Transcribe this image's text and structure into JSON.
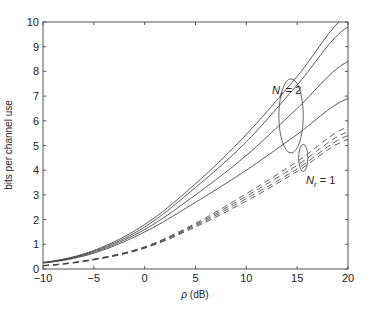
{
  "chart_data": {
    "type": "line",
    "title": "",
    "xlabel": "ρ (dB)",
    "ylabel": "bits per channel use",
    "xlim": [
      -10,
      20
    ],
    "ylim": [
      0,
      10
    ],
    "xticks": [
      -10,
      -5,
      0,
      5,
      10,
      15,
      20
    ],
    "yticks": [
      0,
      1,
      2,
      3,
      4,
      5,
      6,
      7,
      8,
      9,
      10
    ],
    "grid": false,
    "x": [
      -10,
      -5,
      0,
      5,
      10,
      15,
      20
    ],
    "series": [
      {
        "name": "Nr=2 (curve 1)",
        "group": "Nr = 2",
        "style": "solid",
        "values": [
          0.27,
          0.75,
          1.8,
          3.45,
          5.45,
          7.8,
          10.3
        ]
      },
      {
        "name": "Nr=2 (curve 2)",
        "group": "Nr = 2",
        "style": "solid",
        "values": [
          0.26,
          0.72,
          1.7,
          3.3,
          5.15,
          7.45,
          9.8
        ]
      },
      {
        "name": "Nr=2 (curve 3)",
        "group": "Nr = 2",
        "style": "solid",
        "values": [
          0.25,
          0.68,
          1.6,
          3.0,
          4.6,
          6.5,
          8.4
        ]
      },
      {
        "name": "Nr=2 (curve 4)",
        "group": "Nr = 2",
        "style": "solid",
        "values": [
          0.24,
          0.64,
          1.5,
          2.7,
          4.0,
          5.45,
          6.9
        ]
      },
      {
        "name": "Nr=1 (curve 1)",
        "group": "Nr = 1",
        "style": "dashed",
        "values": [
          0.14,
          0.4,
          0.9,
          1.85,
          3.05,
          4.35,
          5.75
        ]
      },
      {
        "name": "Nr=1 (curve 2)",
        "group": "Nr = 1",
        "style": "dashed",
        "values": [
          0.14,
          0.39,
          0.88,
          1.8,
          2.95,
          4.2,
          5.55
        ]
      },
      {
        "name": "Nr=1 (curve 3)",
        "group": "Nr = 1",
        "style": "dashed",
        "values": [
          0.13,
          0.38,
          0.86,
          1.75,
          2.85,
          4.05,
          5.4
        ]
      },
      {
        "name": "Nr=1 (curve 4)",
        "group": "Nr = 1",
        "style": "dashed",
        "values": [
          0.13,
          0.37,
          0.84,
          1.7,
          2.75,
          3.95,
          5.25
        ]
      }
    ],
    "annotations": [
      {
        "text": "N",
        "subscript": "r",
        "suffix": " = 2",
        "x": 13.4,
        "y": 7.2,
        "ellipse": {
          "cx": 14.4,
          "cy": 6.2,
          "rx": 1.2,
          "ry": 1.5
        }
      },
      {
        "text": "N",
        "subscript": "r",
        "suffix": " = 1",
        "x": 15.4,
        "y": 3.3,
        "ellipse": {
          "cx": 15.6,
          "cy": 4.5,
          "rx": 0.45,
          "ry": 0.55
        }
      }
    ]
  },
  "axes": {
    "xlabel_prefix": "ρ",
    "xlabel_suffix": " (dB)",
    "ylabel": "bits per channel use"
  },
  "labels": {
    "nr2_main": "N",
    "nr2_sub": "r",
    "nr2_rest": " = 2",
    "nr1_main": "N",
    "nr1_sub": "r",
    "nr1_rest": " = 1"
  }
}
